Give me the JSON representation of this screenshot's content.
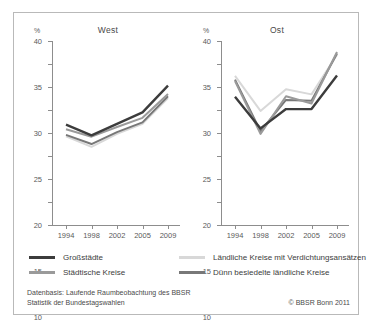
{
  "chart_data": {
    "type": "line",
    "title": "",
    "panels": [
      {
        "name": "West",
        "title": "West",
        "unit": "%",
        "categories": [
          "1994",
          "1998",
          "2002",
          "2005",
          "2009"
        ],
        "ylim": [
          0,
          40
        ],
        "yticks": [
          0,
          5,
          10,
          15,
          20,
          25,
          30,
          35,
          40
        ],
        "grid": false,
        "series": [
          {
            "name": "Großstädte",
            "color": "#3c3c3c",
            "values": [
              21.8,
              19.5,
              22.0,
              24.5,
              30.3
            ]
          },
          {
            "name": "Städtische Kreise",
            "color": "#9a9a9a",
            "values": [
              20.8,
              19.2,
              21.3,
              23.3,
              28.5
            ]
          },
          {
            "name": "Ländliche Kreise mit Verdichtungsansätzen",
            "color": "#d8d8d8",
            "values": [
              19.3,
              17.0,
              19.8,
              22.0,
              27.6
            ]
          },
          {
            "name": "Dünn besiedelte ländliche Kreise",
            "color": "#787878",
            "values": [
              19.6,
              17.6,
              20.2,
              22.3,
              28.0
            ]
          }
        ]
      },
      {
        "name": "Ost",
        "title": "Ost",
        "unit": "%",
        "categories": [
          "1994",
          "1998",
          "2002",
          "2005",
          "2009"
        ],
        "ylim": [
          0,
          40
        ],
        "yticks": [
          0,
          5,
          10,
          15,
          20,
          25,
          30,
          35,
          40
        ],
        "grid": false,
        "series": [
          {
            "name": "Großstädte",
            "color": "#3c3c3c",
            "values": [
              27.9,
              21.0,
              25.2,
              25.2,
              32.5
            ]
          },
          {
            "name": "Städtische Kreise",
            "color": "#9a9a9a",
            "values": [
              31.3,
              19.8,
              28.0,
              26.4,
              37.6
            ]
          },
          {
            "name": "Ländliche Kreise mit Verdichtungsansätzen",
            "color": "#d8d8d8",
            "values": [
              32.4,
              24.8,
              29.5,
              28.4,
              37.0
            ]
          },
          {
            "name": "Dünn besiedelte ländliche Kreise",
            "color": "#787878",
            "values": [
              31.6,
              20.4,
              27.2,
              27.0,
              37.3
            ]
          }
        ]
      }
    ],
    "legend": {
      "position": "bottom",
      "entries": [
        {
          "label": "Großstädte",
          "color": "#3c3c3c"
        },
        {
          "label": "Städtische Kreise",
          "color": "#9a9a9a"
        },
        {
          "label": "Ländliche Kreise mit Verdichtungsansätzen",
          "color": "#d8d8d8"
        },
        {
          "label": "Dünn besiedelte ländliche Kreise",
          "color": "#787878"
        }
      ]
    },
    "xlabel": "",
    "ylabel": "%"
  },
  "footer": {
    "source_line1": "Datenbasis: Laufende Raumbeobachtung des BBSR",
    "source_line2": "Statistik der Bundestagswahlen",
    "copyright": "© BBSR Bonn 2011"
  },
  "colors": {
    "axis": "#8d8d8d",
    "border": "#b9b9b9",
    "text": "#3c3c3c",
    "background": "#ffffff"
  }
}
